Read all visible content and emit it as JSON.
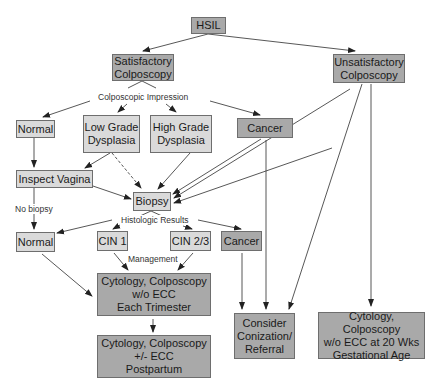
{
  "diagram": {
    "type": "flowchart",
    "title_node": "HSIL",
    "colors": {
      "dark_box": "#a9a9a9",
      "light_box": "#dadada",
      "border": "#6e6e6e",
      "edge": "#444444"
    },
    "nodes": {
      "hsil": "HSIL",
      "satisfactory": "Satisfactory\nColposcopy",
      "unsatisfactory": "Unsatisfactory\nColposcopy",
      "normal1": "Normal",
      "lowgrade": "Low Grade\nDysplasia",
      "highgrade": "High Grade\nDysplasia",
      "cancer1": "Cancer",
      "inspect": "Inspect Vagina",
      "biopsy": "Biopsy",
      "normal2": "Normal",
      "cin1": "CIN 1",
      "cin23": "CIN 2/3",
      "cancer2": "Cancer",
      "cyto_trimester": "Cytology, Colposcopy\nw/o ECC\nEach Trimester",
      "cyto_postpartum": "Cytology, Colposcopy\n+/- ECC\nPostpartum",
      "conization": "Consider\nConization/\nReferral",
      "cyto_20wks": "Cytology, Colposcopy\nw/o ECC at 20 Wks\nGestational Age"
    },
    "edge_labels": {
      "colposcopic": "Colposcopic Impression",
      "histologic": "Histologic Results",
      "management": "Management",
      "no_biopsy": "No biopsy"
    },
    "edges": [
      [
        "HSIL",
        "Satisfactory Colposcopy"
      ],
      [
        "HSIL",
        "Unsatisfactory Colposcopy"
      ],
      [
        "Satisfactory Colposcopy",
        "Normal"
      ],
      [
        "Satisfactory Colposcopy",
        "Low Grade Dysplasia"
      ],
      [
        "Satisfactory Colposcopy",
        "High Grade Dysplasia"
      ],
      [
        "Satisfactory Colposcopy",
        "Cancer"
      ],
      [
        "Normal",
        "Inspect Vagina"
      ],
      [
        "Low Grade Dysplasia",
        "Inspect Vagina"
      ],
      [
        "Low Grade Dysplasia",
        "Biopsy",
        "dashed"
      ],
      [
        "High Grade Dysplasia",
        "Biopsy"
      ],
      [
        "Cancer",
        "Biopsy"
      ],
      [
        "Unsatisfactory Colposcopy",
        "Biopsy"
      ],
      [
        "Inspect Vagina",
        "Biopsy"
      ],
      [
        "Inspect Vagina",
        "Normal (No biopsy)"
      ],
      [
        "Biopsy",
        "Normal"
      ],
      [
        "Biopsy",
        "CIN 1"
      ],
      [
        "Biopsy",
        "CIN 2/3"
      ],
      [
        "Biopsy",
        "Cancer"
      ],
      [
        "Normal",
        "Cytology, Colposcopy w/o ECC Each Trimester"
      ],
      [
        "CIN 1",
        "Cytology, Colposcopy w/o ECC Each Trimester"
      ],
      [
        "CIN 2/3",
        "Cytology, Colposcopy w/o ECC Each Trimester"
      ],
      [
        "Cytology, Colposcopy w/o ECC Each Trimester",
        "Cytology, Colposcopy +/- ECC Postpartum"
      ],
      [
        "Cancer (histologic)",
        "Consider Conization/Referral"
      ],
      [
        "Cancer (colposcopic)",
        "Consider Conization/Referral"
      ],
      [
        "Unsatisfactory Colposcopy",
        "Consider Conization/Referral"
      ],
      [
        "Unsatisfactory Colposcopy",
        "Cytology, Colposcopy w/o ECC at 20 Wks Gestational Age"
      ]
    ]
  }
}
